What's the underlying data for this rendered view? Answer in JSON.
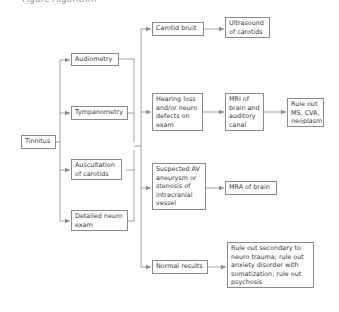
{
  "caption": {
    "text": "Figure Algorithm"
  },
  "diagram": {
    "colors": {
      "line": "#8a8a8a",
      "text": "#3c3c3c",
      "border": "#8a8a8a"
    },
    "nodes": {
      "tinnitus": "Tinnitus",
      "audiometry": "Audiometry",
      "tympanometry": "Tympanometry",
      "auscultation": "Auscultation\nof carotids",
      "neuro_exam": "Detailed neuro\nexam",
      "carotid_bruit": "Carotid bruit",
      "hearing_loss": "Hearing loss\nand/or neuro\ndefects on\nexam",
      "suspected_av": "Suspected AV\naneurysm or\nstenosis of\nintracranial\nvessel",
      "normal_results": "Normal results",
      "ultrasound": "Ultrasound\nof carotids",
      "mri": "MRI of\nbrain and\nauditory\ncanal",
      "rule_out_ms": "Rule out\nMS, CVA,\nneoplasm",
      "mra": "MRA of brain",
      "rule_out_secondary": "Rule out secondary to\nneuro trauma; rule out\nanxiety disorder with\nsomatization;  rule out\npsychosis"
    },
    "edges": [
      [
        "tinnitus",
        "audiometry"
      ],
      [
        "tinnitus",
        "tympanometry"
      ],
      [
        "tinnitus",
        "auscultation"
      ],
      [
        "tinnitus",
        "neuro_exam"
      ],
      [
        "tests",
        "carotid_bruit"
      ],
      [
        "tests",
        "hearing_loss"
      ],
      [
        "tests",
        "suspected_av"
      ],
      [
        "tests",
        "normal_results"
      ],
      [
        "carotid_bruit",
        "ultrasound"
      ],
      [
        "hearing_loss",
        "mri"
      ],
      [
        "mri",
        "rule_out_ms"
      ],
      [
        "suspected_av",
        "mra"
      ],
      [
        "normal_results",
        "rule_out_secondary"
      ]
    ]
  }
}
